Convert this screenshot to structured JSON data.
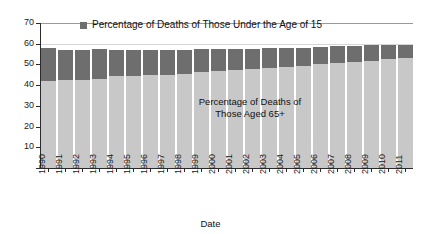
{
  "chart_data": {
    "type": "bar",
    "subtype": "stacked-bar",
    "title": "",
    "xlabel": "Date",
    "ylabel": "",
    "ylim": [
      0,
      70
    ],
    "ytick_step": 10,
    "grid": false,
    "legend_position": "top-center-inside",
    "categories": [
      "1990",
      "1991",
      "1992",
      "1993",
      "1994",
      "1995",
      "1996",
      "1997",
      "1998",
      "1999",
      "2000",
      "2001",
      "2002",
      "2003",
      "2004",
      "2005",
      "2006",
      "2007",
      "2008",
      "2009",
      "2010",
      "2011"
    ],
    "series": [
      {
        "name": "Percentage of Deaths of Those Aged 65+",
        "color": "#c8c8c8",
        "values": [
          42.0,
          42.3,
          42.6,
          43.2,
          44.2,
          44.4,
          44.8,
          45.0,
          45.5,
          46.3,
          46.8,
          47.3,
          47.8,
          48.3,
          48.8,
          49.4,
          50.0,
          50.6,
          51.1,
          51.7,
          52.4,
          53.0
        ]
      },
      {
        "name": "Percentage of Deaths of Those Under the Age of 15",
        "color": "#6e6e6e",
        "values": [
          16.0,
          14.6,
          14.3,
          14.1,
          12.9,
          12.6,
          12.3,
          12.0,
          11.6,
          11.0,
          10.6,
          10.2,
          9.8,
          9.4,
          9.0,
          8.7,
          8.4,
          8.1,
          7.8,
          7.5,
          7.1,
          6.6
        ]
      }
    ],
    "totals": [
      58.0,
      56.9,
      56.9,
      57.3,
      57.1,
      57.0,
      57.1,
      57.0,
      57.1,
      57.3,
      57.4,
      57.5,
      57.6,
      57.7,
      57.8,
      58.1,
      58.4,
      58.7,
      58.9,
      59.2,
      59.5,
      59.6
    ],
    "ytick_labels": [
      "70",
      "60",
      "50",
      "40",
      "30",
      "20",
      "10",
      ""
    ]
  },
  "legend": {
    "marker": "legend-swatch-square",
    "label": "Percentage of Deaths of Those Under the Age of 15"
  },
  "annotation": {
    "line1": "Percentage of Deaths of",
    "line2": "Those Aged 65+"
  },
  "axis": {
    "x_title": "Date"
  }
}
